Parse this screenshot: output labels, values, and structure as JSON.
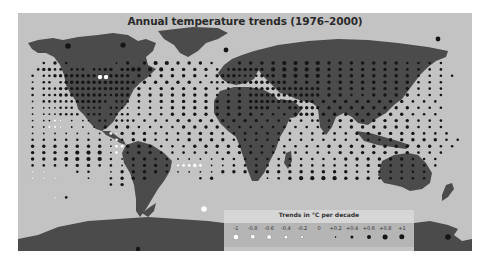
{
  "title": "Annual temperature trends (1976–2000)",
  "colors": {
    "ocean": "#c3c3c3",
    "land": "#4b4b4b",
    "warming_dot": "#151515",
    "cooling_dot": "#ffffff",
    "cooling_dot_stroke": "#8a8a8a",
    "legend_bg": "#b5b5b5",
    "legend_title_bg": "#d6d6d6"
  },
  "legend": {
    "title": "Trends in °C per decade",
    "items": [
      {
        "label": "-1",
        "value": -1.0,
        "kind": "cooling",
        "radius": 2.6
      },
      {
        "label": "-0.8",
        "value": -0.8,
        "kind": "cooling",
        "radius": 2.2
      },
      {
        "label": "-0.6",
        "value": -0.6,
        "kind": "cooling",
        "radius": 1.9
      },
      {
        "label": "-0.4",
        "value": -0.4,
        "kind": "cooling",
        "radius": 1.6
      },
      {
        "label": "-0.2",
        "value": -0.2,
        "kind": "cooling",
        "radius": 0.9
      },
      {
        "label": "0",
        "value": 0,
        "kind": "none",
        "radius": 0
      },
      {
        "label": "+0.2",
        "value": 0.2,
        "kind": "warming",
        "radius": 0.9
      },
      {
        "label": "+0.4",
        "value": 0.4,
        "kind": "warming",
        "radius": 1.6
      },
      {
        "label": "+0.6",
        "value": 0.6,
        "kind": "warming",
        "radius": 2.0
      },
      {
        "label": "+0.8",
        "value": 0.8,
        "kind": "warming",
        "radius": 2.4
      },
      {
        "label": "+1",
        "value": 1.0,
        "kind": "warming",
        "radius": 2.7
      }
    ]
  },
  "grid": {
    "x0": 9,
    "y0": 50,
    "dx": 6.6,
    "dy": 6.4,
    "encoding": "space=no data, 1-5 warming level (+0.2..+1), a-e cooling level (-0.2..-1)",
    "rows": [
      "   2 3 2        1 3  3 4 4 3 3 3 2    3 3 3 3 4 4 4 4 3 3 3 3 3 3 3 2 2 2 2    ",
      "  23322 222 2233 3344 4 4 3 3 3 3 2 2333333 4 4 4 4 4 3 3 3 3 3 3 3 2 2 2 2  ",
      " 2 2233333333333333 3 2 3 3 3 3 2 33332222333 4 4 4 4 3 3 3 3 3 3 3 3 2 2 2 2 ",
      " 1 22 23333333333333 3 3 3 3 3 2 22222233333333 3 3 3 3 3 3 3 3 3 3 3 2 2 2  ",
      " 2 2223333333333333 3 2 3 3 3 3 3 2 2 2 2333333333333 3 3 3 3 3 3 3 3 2 2 2  ",
      " 2 2223333333322333 3 3 3 3 3 3 3 2 2 3 3333333333333 3 3 2 2 3 3 3 3 2 2 2  ",
      " 1 222222333332 222 2 2 3 3 3 3 3 3 3 3 333333333333 3 3 3 3 3 3 3 3 2 2 2  ",
      " 1 111222 2222 2221 2 2 2 3 3 3 3 3 3 3 3333 2 333333 3 3 3 3 3 3 3 3 2 2 2 ",
      " 1 1112222 222 2222 2 2 2 3 3 3 3 3 3 3 3 2 2 2 3333 3 3 3 3 3 3 3 3 2 2 2  ",
      " 1 11ba 1 11 22 2222 2 2 2 3 3 3 3 3 3 3 3 2 2 2 2 22 2 3 3 3 3 3 3 3 2 2 2 ",
      " 1 1bba 1 1 1 3 3 3 2 2 2 2 3 3 3 3 2 2 2 2 2 2 2 2 2 2 2 3 3 3 3 3 3 2 2 2 ",
      " 1 1 1 1 1 1 1 ba3 3 3 2 2 2 3 3 3 2 2 2 2 2 2 2 2 2 2 2 2 3 3 3 3 3 3 2 2 2 ",
      " 2 2 2 2 2 2 2 1b2 3 3 2 2 2 3 3 3 3 2 2 2 2 2 2 2 2 2 2 2 2 2 2 3 3 3 3 3 2 2",
      " 3 3 3 3 3 3 3 1cc3 3 3 2 2 2 3 3 3 3 3 2 2 2 2 2 2 2 3 3 3 3 3 3 3 3 3 3 2 2",
      " 3 3 3 3 4 4 4 1c 2 3 3 2 2 2 2 2 2 3 3 3 2 2 2 2 2 2 2 3 3 3 3 3 3 3 2 2 2 ",
      " 3 3 3 4 4 4 4 2 1 3 3 2 2 1 1 1 1 2 2 2 2 2 2 2 2 2 2 2 3 3 3 3 3 3 2 2 2  ",
      " 2 2 2 2 3 3 2 2 1 2 3 3 2 bccdc 1 1 2 2 2 2 2 2 2 2 2 2 2 2 3 3 2 2 2 2 2  ",
      " a a     2 2   1 3 3 3 3 2 1 1 1 1 3 3 3 3 3 3 3 3 3 3 3 3 2 2 2 2 2 2 2    ",
      " a a a     1   2 3 3 3         2 3         1 2 3 4 4 4 4 3 3 3 2 2 2 2 2    ",
      "               2 3                                                          ",
      "                                                                            ",
      "     a 2                                                                    "
    ]
  }
}
